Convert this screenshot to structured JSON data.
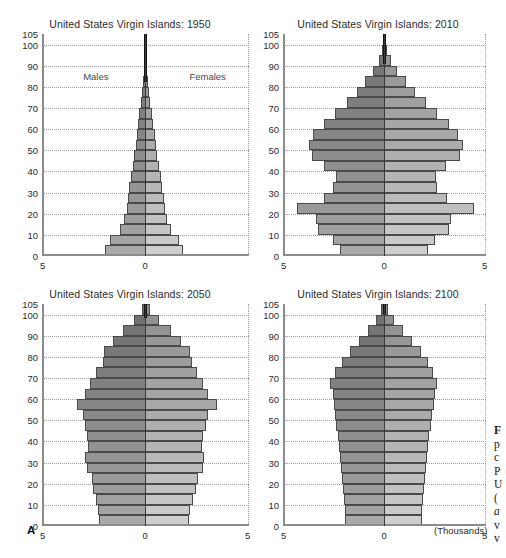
{
  "figure": {
    "panel_letter": "A",
    "units_label": "(Thousands)",
    "sex_labels": {
      "male": "Males",
      "female": "Females"
    },
    "accent_colors": {
      "male_dark": "#6f6f6f",
      "male_light": "#a9a9a9",
      "female_dark": "#8f8f8f",
      "female_light": "#cfcfcf",
      "axis": "#8c8c8c",
      "center_line": "#3a3a3a",
      "grid": "#9a9a9a",
      "text": "#2b2b2b"
    },
    "clipped_caption_lines": [
      "F",
      "p",
      "c",
      "P",
      "U",
      "(",
      "a",
      "v",
      "v"
    ]
  },
  "chart_data": [
    {
      "type": "bar",
      "subtype": "population-pyramid",
      "title": "United States Virgin Islands: 1950",
      "xlabel": "(Thousands)",
      "ylabel": "",
      "xlim": [
        -5,
        5
      ],
      "xticks": [
        "5",
        "0"
      ],
      "yticks": [
        0,
        10,
        20,
        30,
        40,
        50,
        60,
        70,
        80,
        90,
        100,
        105
      ],
      "grid": true,
      "legend": [
        "Males",
        "Females"
      ],
      "legend_position": "inside-top",
      "age_groups": [
        "0-4",
        "5-9",
        "10-14",
        "15-19",
        "20-24",
        "25-29",
        "30-34",
        "35-39",
        "40-44",
        "45-49",
        "50-54",
        "55-59",
        "60-64",
        "65-69",
        "70-74",
        "75-79",
        "80-84",
        "85-89",
        "90-94",
        "95-99",
        "100+"
      ],
      "series": [
        {
          "name": "Males",
          "values": [
            1.95,
            1.7,
            1.25,
            1.05,
            0.9,
            0.85,
            0.8,
            0.72,
            0.62,
            0.55,
            0.47,
            0.42,
            0.37,
            0.3,
            0.23,
            0.16,
            0.11,
            0.06,
            0.05,
            0.05,
            0.05
          ]
        },
        {
          "name": "Females",
          "values": [
            1.8,
            1.62,
            1.22,
            1.05,
            0.92,
            0.88,
            0.82,
            0.74,
            0.64,
            0.57,
            0.5,
            0.44,
            0.38,
            0.31,
            0.24,
            0.17,
            0.12,
            0.06,
            0.05,
            0.05,
            0.05
          ]
        }
      ]
    },
    {
      "type": "bar",
      "subtype": "population-pyramid",
      "title": "United States Virgin Islands: 2010",
      "xlabel": "(Thousands)",
      "ylabel": "",
      "xlim": [
        -5,
        5
      ],
      "xticks": [
        "5",
        "0",
        "5"
      ],
      "yticks": [
        0,
        10,
        20,
        30,
        40,
        50,
        60,
        70,
        80,
        90,
        100,
        105
      ],
      "grid": true,
      "legend": [
        "Males",
        "Females"
      ],
      "age_groups": [
        "0-4",
        "5-9",
        "10-14",
        "15-19",
        "20-24",
        "25-29",
        "30-34",
        "35-39",
        "40-44",
        "45-49",
        "50-54",
        "55-59",
        "60-64",
        "65-69",
        "70-74",
        "75-79",
        "80-84",
        "85-89",
        "90-94",
        "95-99",
        "100+"
      ],
      "series": [
        {
          "name": "Males",
          "values": [
            2.2,
            2.55,
            3.3,
            3.35,
            4.3,
            3.0,
            2.55,
            2.4,
            3.0,
            3.55,
            3.7,
            3.5,
            3.0,
            2.45,
            1.85,
            1.35,
            0.95,
            0.55,
            0.25,
            0.1,
            0.05
          ]
        },
        {
          "name": "Females",
          "values": [
            2.15,
            2.5,
            3.2,
            3.3,
            4.4,
            3.1,
            2.6,
            2.55,
            3.05,
            3.7,
            3.85,
            3.6,
            3.2,
            2.6,
            2.05,
            1.5,
            1.05,
            0.62,
            0.3,
            0.12,
            0.06
          ]
        }
      ]
    },
    {
      "type": "bar",
      "subtype": "population-pyramid",
      "title": "United States Virgin Islands: 2050",
      "xlabel": "(Thousands)",
      "ylabel": "",
      "xlim": [
        -5,
        5
      ],
      "xticks": [
        "5",
        "0",
        "5"
      ],
      "yticks": [
        0,
        10,
        20,
        30,
        40,
        50,
        60,
        70,
        80,
        90,
        100,
        105
      ],
      "grid": true,
      "legend": [
        "Males",
        "Females"
      ],
      "age_groups": [
        "0-4",
        "5-9",
        "10-14",
        "15-19",
        "20-24",
        "25-29",
        "30-34",
        "35-39",
        "40-44",
        "45-49",
        "50-54",
        "55-59",
        "60-64",
        "65-69",
        "70-74",
        "75-79",
        "80-84",
        "85-89",
        "90-94",
        "95-99",
        "100+"
      ],
      "series": [
        {
          "name": "Males",
          "values": [
            2.25,
            2.3,
            2.4,
            2.55,
            2.6,
            2.85,
            2.9,
            2.8,
            2.85,
            2.9,
            3.0,
            3.3,
            2.9,
            2.7,
            2.4,
            2.05,
            2.0,
            1.55,
            1.1,
            0.55,
            0.18
          ]
        },
        {
          "name": "Females",
          "values": [
            2.1,
            2.15,
            2.3,
            2.45,
            2.55,
            2.8,
            2.85,
            2.75,
            2.8,
            2.9,
            3.0,
            3.45,
            3.0,
            2.8,
            2.5,
            2.25,
            2.15,
            1.7,
            1.25,
            0.65,
            0.22
          ]
        }
      ]
    },
    {
      "type": "bar",
      "subtype": "population-pyramid",
      "title": "United States Virgin Islands: 2100",
      "xlabel": "(Thousands)",
      "ylabel": "",
      "xlim": [
        -5,
        5
      ],
      "xticks": [
        "5",
        "0",
        "5"
      ],
      "yticks": [
        0,
        10,
        20,
        30,
        40,
        50,
        60,
        70,
        80,
        90,
        100,
        105
      ],
      "grid": true,
      "legend": [
        "Males",
        "Females"
      ],
      "age_groups": [
        "0-4",
        "5-9",
        "10-14",
        "15-19",
        "20-24",
        "25-29",
        "30-34",
        "35-39",
        "40-44",
        "45-49",
        "50-54",
        "55-59",
        "60-64",
        "65-69",
        "70-74",
        "75-79",
        "80-84",
        "85-89",
        "90-94",
        "95-99",
        "100+"
      ],
      "series": [
        {
          "name": "Males",
          "values": [
            1.95,
            1.95,
            2.0,
            2.05,
            2.1,
            2.15,
            2.2,
            2.25,
            2.3,
            2.4,
            2.45,
            2.5,
            2.55,
            2.7,
            2.45,
            2.1,
            1.7,
            1.25,
            0.8,
            0.4,
            0.15
          ]
        },
        {
          "name": "Females",
          "values": [
            1.85,
            1.85,
            1.9,
            1.95,
            2.0,
            2.05,
            2.1,
            2.15,
            2.2,
            2.3,
            2.35,
            2.45,
            2.5,
            2.6,
            2.4,
            2.15,
            1.8,
            1.35,
            0.9,
            0.45,
            0.18
          ]
        }
      ]
    }
  ]
}
